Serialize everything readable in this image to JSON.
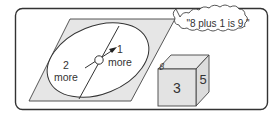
{
  "spinner": {
    "sector_left": {
      "number": "2",
      "word": "more"
    },
    "sector_right": {
      "number": "1",
      "word": "more"
    }
  },
  "thought_bubble": {
    "text": "\"8 plus 1 is 9.\""
  },
  "cube": {
    "front": "3",
    "right": "5",
    "top": "8"
  },
  "colors": {
    "frame": "#333333",
    "board": "#e6e6e6",
    "ellipse_fill": "#ffffff",
    "cube_face": "#e0e0e0",
    "ink": "#333333"
  }
}
